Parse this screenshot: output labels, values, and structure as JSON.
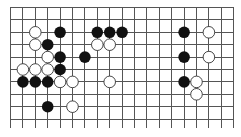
{
  "board": {
    "origin_x": 10,
    "origin_y": 7,
    "spacing": 12.4,
    "columns": 19,
    "visible_rows": 10,
    "line_extend_bottom": 128,
    "stone_radius": 5.8,
    "colors": {
      "line": "#555555",
      "black": "#111111",
      "white": "#ffffff",
      "background": "#ffffff"
    }
  },
  "stones": [
    {
      "color": "white",
      "col": 2,
      "row": 2
    },
    {
      "color": "black",
      "col": 4,
      "row": 2
    },
    {
      "color": "black",
      "col": 7,
      "row": 2
    },
    {
      "color": "black",
      "col": 8,
      "row": 2
    },
    {
      "color": "black",
      "col": 9,
      "row": 2
    },
    {
      "color": "black",
      "col": 14,
      "row": 2
    },
    {
      "color": "white",
      "col": 16,
      "row": 2
    },
    {
      "color": "white",
      "col": 2,
      "row": 3
    },
    {
      "color": "black",
      "col": 3,
      "row": 3
    },
    {
      "color": "white",
      "col": 7,
      "row": 3
    },
    {
      "color": "white",
      "col": 8,
      "row": 3
    },
    {
      "color": "white",
      "col": 3,
      "row": 4
    },
    {
      "color": "black",
      "col": 4,
      "row": 4
    },
    {
      "color": "black",
      "col": 6,
      "row": 4
    },
    {
      "color": "black",
      "col": 14,
      "row": 4
    },
    {
      "color": "white",
      "col": 16,
      "row": 4
    },
    {
      "color": "white",
      "col": 1,
      "row": 5
    },
    {
      "color": "white",
      "col": 2,
      "row": 5
    },
    {
      "color": "white",
      "col": 3,
      "row": 5
    },
    {
      "color": "black",
      "col": 4,
      "row": 5
    },
    {
      "color": "black",
      "col": 1,
      "row": 6
    },
    {
      "color": "black",
      "col": 2,
      "row": 6
    },
    {
      "color": "black",
      "col": 3,
      "row": 6
    },
    {
      "color": "white",
      "col": 4,
      "row": 6
    },
    {
      "color": "white",
      "col": 5,
      "row": 6
    },
    {
      "color": "white",
      "col": 8,
      "row": 6
    },
    {
      "color": "black",
      "col": 14,
      "row": 6
    },
    {
      "color": "white",
      "col": 15,
      "row": 6
    },
    {
      "color": "white",
      "col": 15,
      "row": 7
    },
    {
      "color": "black",
      "col": 3,
      "row": 8
    },
    {
      "color": "white",
      "col": 5,
      "row": 8
    }
  ]
}
